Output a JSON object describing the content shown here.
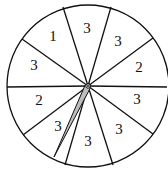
{
  "spinner": {
    "center": [
      88,
      86
    ],
    "radius": 81,
    "sectors": [
      {
        "label": "3",
        "pos": [
          87,
          30
        ]
      },
      {
        "label": "3",
        "pos": [
          118,
          43
        ]
      },
      {
        "label": "2",
        "pos": [
          139,
          69
        ]
      },
      {
        "label": "3",
        "pos": [
          137,
          101
        ]
      },
      {
        "label": "3",
        "pos": [
          119,
          131
        ]
      },
      {
        "label": "3",
        "pos": [
          88,
          143
        ]
      },
      {
        "label": "3",
        "pos": [
          58,
          128
        ]
      },
      {
        "label": "2",
        "pos": [
          39,
          102
        ]
      },
      {
        "label": "3",
        "pos": [
          34,
          67
        ]
      },
      {
        "label": "1",
        "pos": [
          53,
          38
        ]
      }
    ],
    "boundary_points": [
      [
        63,
        7
      ],
      [
        111,
        7
      ],
      [
        153,
        38
      ],
      [
        167,
        87
      ],
      [
        153,
        134
      ],
      [
        113,
        165
      ],
      [
        65,
        165
      ],
      [
        23,
        135
      ],
      [
        7,
        87
      ],
      [
        22,
        39
      ]
    ],
    "pointer": {
      "tip": [
        54,
        157
      ],
      "color": "#bdbdbd"
    }
  }
}
